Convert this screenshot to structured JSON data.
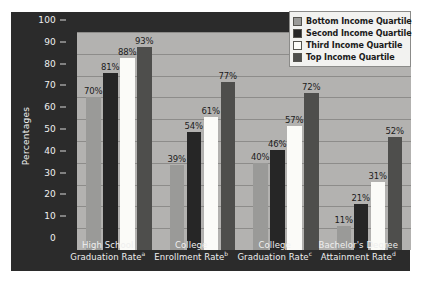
{
  "chart_data": {
    "type": "bar",
    "title": "",
    "xlabel": "",
    "ylabel": "Percentages",
    "ylim": [
      0,
      100
    ],
    "ytick_step": 10,
    "yticks": [
      100,
      90,
      80,
      70,
      60,
      50,
      40,
      30,
      20,
      10,
      0
    ],
    "grid": true,
    "legend_position": "top-right",
    "categories": [
      "High School Graduation Rate",
      "College Enrollment Rate",
      "College Graduation Rate",
      "Bachelor's Degree Attainment Rate"
    ],
    "category_lines": [
      [
        "High School",
        "Graduation Rate",
        "a"
      ],
      [
        "College",
        "Enrollment Rate",
        "b"
      ],
      [
        "College",
        "Graduation Rate",
        "c"
      ],
      [
        "Bachelor's Degree",
        "Attainment Rate",
        "d"
      ]
    ],
    "series": [
      {
        "name": "Bottom Income Quartile",
        "color": "#9a9a98",
        "values": [
          70,
          39,
          40,
          11
        ],
        "labels": [
          "70%",
          "39%",
          "40%",
          "11%"
        ]
      },
      {
        "name": "Second Income Quartile",
        "color": "#262626",
        "values": [
          81,
          54,
          46,
          21
        ],
        "labels": [
          "81%",
          "54%",
          "46%",
          "21%"
        ]
      },
      {
        "name": "Third Income Quartile",
        "color": "#fbfbf8",
        "values": [
          88,
          61,
          57,
          31
        ],
        "labels": [
          "88%",
          "61%",
          "57%",
          "31%"
        ]
      },
      {
        "name": "Top Income Quartile",
        "color": "#4e4e4c",
        "values": [
          93,
          77,
          72,
          52
        ],
        "labels": [
          "93%",
          "77%",
          "72%",
          "52%"
        ]
      }
    ]
  },
  "colors": {
    "figure_background": "#2b2b2b",
    "plot_background": "#b3b2b0",
    "gridline": "#8d8c8a",
    "axis_text": "#efefef",
    "value_label_text": "#1c1c1c",
    "legend_background": "#f2f2f0",
    "legend_border": "#8b8b89"
  }
}
